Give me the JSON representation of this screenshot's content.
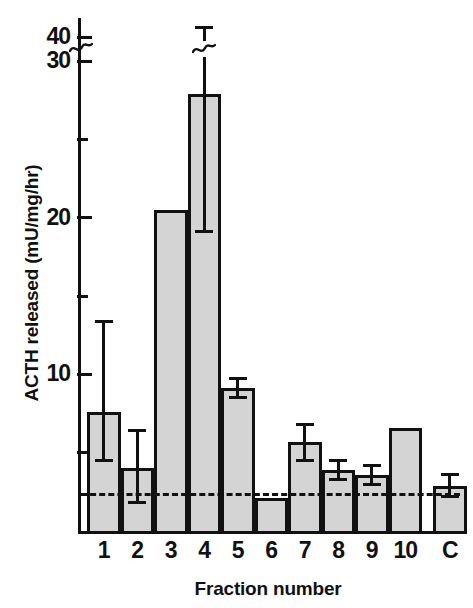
{
  "chart_data": {
    "type": "bar",
    "title": "",
    "xlabel": "Fraction number",
    "ylabel": "ACTH released (mU/mg/hr)",
    "categories": [
      "1",
      "2",
      "3",
      "4",
      "5",
      "6",
      "7",
      "8",
      "9",
      "10",
      "C"
    ],
    "values": [
      7.6,
      4.0,
      20.5,
      27.9,
      9.1,
      2.1,
      5.7,
      3.9,
      3.6,
      6.6,
      2.9
    ],
    "err_low": [
      4.4,
      1.7,
      null,
      19.0,
      8.4,
      null,
      4.4,
      3.2,
      2.9,
      null,
      2.1
    ],
    "err_high": [
      13.5,
      6.5,
      null,
      44.5,
      9.8,
      null,
      6.9,
      4.6,
      4.3,
      null,
      3.7
    ],
    "ylim": [
      0,
      45
    ],
    "yticks_major": [
      10,
      20,
      30,
      40
    ],
    "yticks_minor": [
      5,
      15,
      25
    ],
    "ytick_labels": [
      "10",
      "20",
      "30",
      "40"
    ],
    "axis_break": {
      "between": [
        30,
        40
      ],
      "present": true
    },
    "error_bar_break": {
      "category": "4",
      "present": true
    },
    "reference_line": {
      "value": 2.45,
      "style": "dashed",
      "label": ""
    },
    "grid": false,
    "legend": null,
    "bar_fill_color": "#d4d4d4",
    "bar_edge_color": "#111111",
    "background_color": "#ffffff"
  },
  "axis": {
    "y_tick_labels": [
      {
        "text": "40",
        "value": 40
      },
      {
        "text": "30",
        "value": 30
      },
      {
        "text": "20",
        "value": 20
      },
      {
        "text": "10",
        "value": 10
      }
    ],
    "x_tick_labels": [
      "1",
      "2",
      "3",
      "4",
      "5",
      "6",
      "7",
      "8",
      "9",
      "10",
      "C"
    ],
    "y_title": "ACTH released (mU/mg/hr)",
    "x_title": "Fraction number"
  }
}
